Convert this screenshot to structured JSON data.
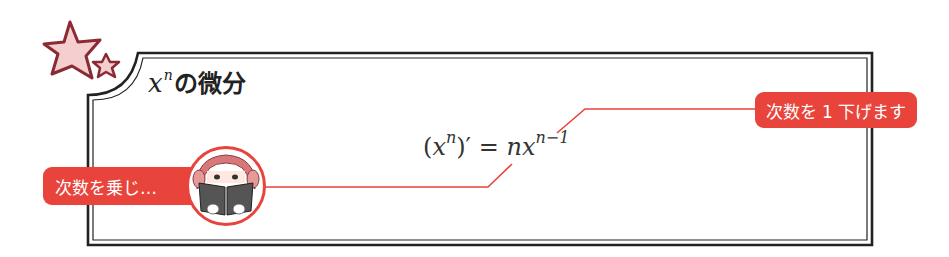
{
  "box": {
    "title_var": "x",
    "title_sup": "n",
    "title_text": "の微分"
  },
  "formula": {
    "lhs_open": "(",
    "lhs_var": "x",
    "lhs_sup": "n",
    "lhs_close": ")′",
    "equals": " = ",
    "rhs_coef": "n",
    "rhs_var": "x",
    "rhs_sup": "n−1"
  },
  "callouts": {
    "left_label": "次数を乗じ…",
    "right_label": "次数を 1 下げます"
  },
  "icons": {
    "stars": "stars-icon",
    "avatar": "reading-girl-avatar"
  },
  "colors": {
    "accent_red": "#e8443c",
    "star_fill": "#f5cfd0",
    "star_stroke": "#8a2a32",
    "frame": "#222222"
  }
}
